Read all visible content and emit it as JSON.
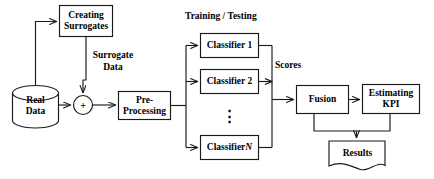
{
  "diagram": {
    "stroke_color": "#1a1a1a",
    "fill_color": "#ffffff",
    "nodes": {
      "creating_surrogates": "Creating\nSurrogates",
      "real_data": "Real\nData",
      "adder": "+",
      "pre_processing": "Pre-\nProcessing",
      "classifier_1": "Classifier 1",
      "classifier_2": "Classifier 2",
      "classifier_ellipsis": "⋮",
      "classifier_n_prefix": "Classifier ",
      "classifier_n_index": "N",
      "fusion": "Fusion",
      "estimating_kpi": "Estimating\nKPI",
      "results": "Results"
    },
    "labels": {
      "surrogate_data": "Surrogate\nData",
      "training_testing": "Training / Testing",
      "scores": "Scores"
    }
  }
}
